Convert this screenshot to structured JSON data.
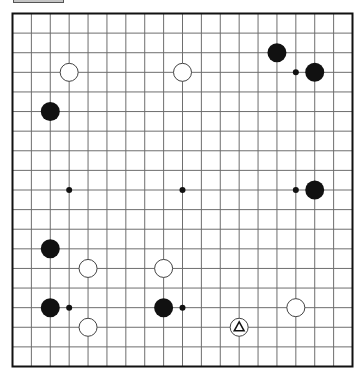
{
  "toolbar": {
    "button_label": ""
  },
  "board": {
    "size": 19,
    "colors": {
      "background": "#ffffff",
      "grid_line": "#6e6e6e",
      "border": "#111111",
      "black_stone": "#111111",
      "white_stone": "#ffffff",
      "white_stone_outline": "#444444",
      "star_point": "#111111",
      "marker": "#111111"
    },
    "star_points": [
      [
        3,
        3
      ],
      [
        9,
        3
      ],
      [
        15,
        3
      ],
      [
        3,
        9
      ],
      [
        9,
        9
      ],
      [
        15,
        9
      ],
      [
        3,
        15
      ],
      [
        9,
        15
      ],
      [
        15,
        15
      ]
    ],
    "stones": [
      {
        "color": "black",
        "col": 14,
        "row": 2
      },
      {
        "color": "black",
        "col": 16,
        "row": 3
      },
      {
        "color": "black",
        "col": 2,
        "row": 5
      },
      {
        "color": "black",
        "col": 16,
        "row": 9
      },
      {
        "color": "black",
        "col": 2,
        "row": 12
      },
      {
        "color": "black",
        "col": 2,
        "row": 15
      },
      {
        "color": "black",
        "col": 8,
        "row": 15
      },
      {
        "color": "white",
        "col": 3,
        "row": 3
      },
      {
        "color": "white",
        "col": 9,
        "row": 3
      },
      {
        "color": "white",
        "col": 4,
        "row": 13
      },
      {
        "color": "white",
        "col": 8,
        "row": 13
      },
      {
        "color": "white",
        "col": 15,
        "row": 15
      },
      {
        "color": "white",
        "col": 4,
        "row": 16
      },
      {
        "color": "white",
        "col": 12,
        "row": 16,
        "marker": "triangle"
      }
    ]
  }
}
